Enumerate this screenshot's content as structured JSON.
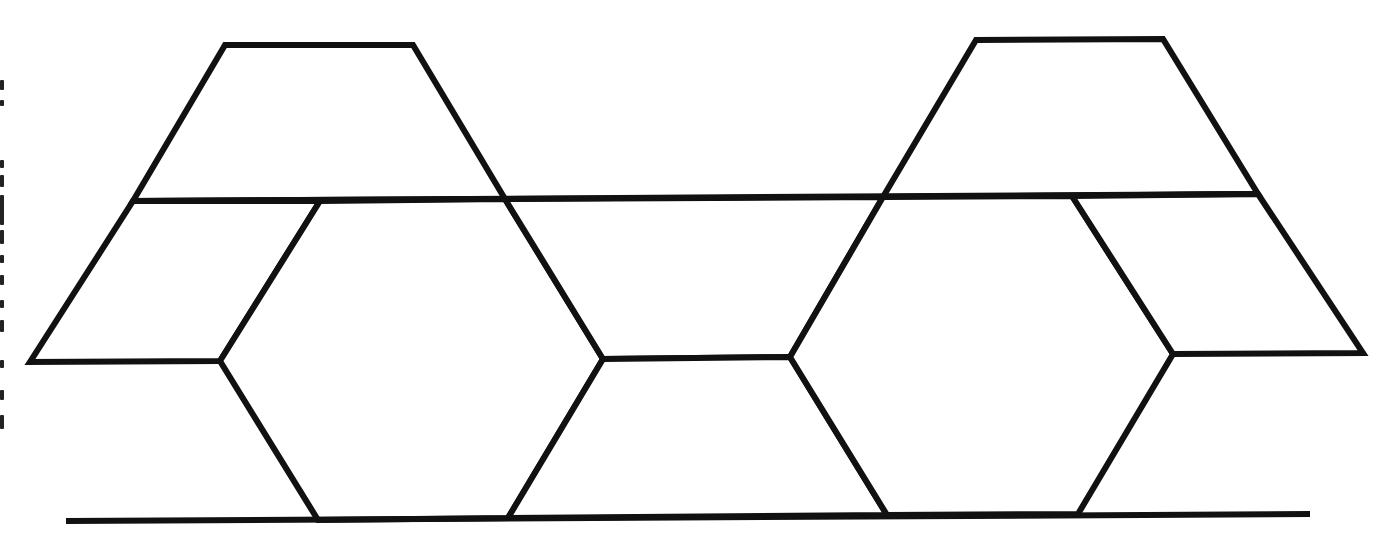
{
  "diagram": {
    "title": "",
    "type": "tessellation-line-drawing",
    "stroke_color": "#111111",
    "background_color": "#ffffff",
    "shapes": [
      {
        "name": "trapezoid-top-left",
        "points": [
          [
            225,
            45
          ],
          [
            413,
            45
          ],
          [
            505,
            199
          ],
          [
            133,
            201
          ]
        ]
      },
      {
        "name": "trapezoid-top-right",
        "points": [
          [
            976,
            40
          ],
          [
            1163,
            39
          ],
          [
            1258,
            194
          ],
          [
            883,
            197
          ]
        ]
      },
      {
        "name": "parallelogram-left",
        "points": [
          [
            133,
            201
          ],
          [
            320,
            201
          ],
          [
            220,
            361
          ],
          [
            30,
            362
          ]
        ]
      },
      {
        "name": "hexagon-left",
        "points": [
          [
            320,
            201
          ],
          [
            505,
            199
          ],
          [
            603,
            359
          ],
          [
            508,
            518
          ],
          [
            318,
            520
          ],
          [
            220,
            361
          ]
        ]
      },
      {
        "name": "trapezoid-middle-inverted",
        "points": [
          [
            505,
            199
          ],
          [
            883,
            197
          ],
          [
            790,
            357
          ],
          [
            603,
            359
          ]
        ]
      },
      {
        "name": "trapezoid-bottom-middle",
        "points": [
          [
            603,
            359
          ],
          [
            790,
            357
          ],
          [
            887,
            515
          ],
          [
            508,
            518
          ]
        ]
      },
      {
        "name": "hexagon-right",
        "points": [
          [
            883,
            197
          ],
          [
            1072,
            196
          ],
          [
            1173,
            354
          ],
          [
            1078,
            514
          ],
          [
            887,
            515
          ],
          [
            790,
            357
          ]
        ]
      },
      {
        "name": "parallelogram-right",
        "points": [
          [
            1072,
            196
          ],
          [
            1258,
            194
          ],
          [
            1363,
            353
          ],
          [
            1173,
            354
          ]
        ]
      }
    ],
    "lines": [
      {
        "name": "upper-horizontal-line",
        "from": [
          133,
          201
        ],
        "to": [
          1258,
          194
        ]
      },
      {
        "name": "base-line",
        "from": [
          66,
          521
        ],
        "to": [
          1310,
          514
        ]
      }
    ],
    "left_margin_text": "(vertical text, clipped at image edge — illegible)"
  }
}
